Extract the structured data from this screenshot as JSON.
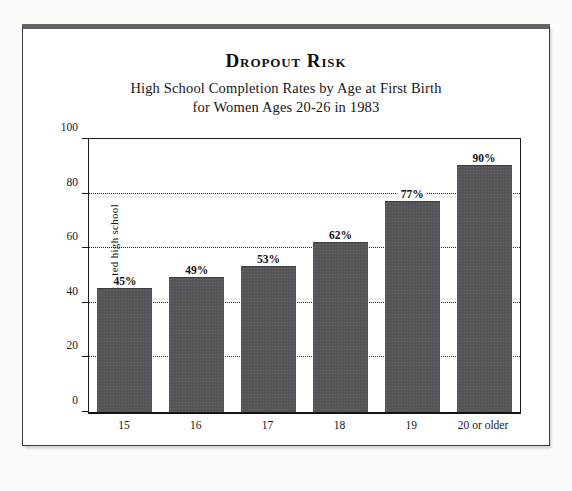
{
  "figure": {
    "title": "Dropout Risk",
    "subtitle_line1": "High School Completion Rates by Age at First Birth",
    "subtitle_line2": "for Women Ages 20-26 in 1983"
  },
  "colors": {
    "bar_fill": "#56565a",
    "frame": "#3c3c40",
    "text": "#16161a",
    "page_background": "#fbfbfa",
    "plot_background": "#ffffff"
  },
  "chart_data": {
    "type": "bar",
    "title": "Dropout Risk",
    "subtitle": "High School Completion Rates by Age at First Birth for Women Ages 20-26 in 1983",
    "xlabel": "Age of mother at first birth",
    "ylabel": "Percent completed high school",
    "categories": [
      "15",
      "16",
      "17",
      "18",
      "19",
      "20 or older"
    ],
    "values": [
      45,
      49,
      53,
      62,
      77,
      90
    ],
    "data_labels": [
      "45%",
      "49%",
      "53%",
      "62%",
      "77%",
      "90%"
    ],
    "ylim": [
      0,
      100
    ],
    "yticks": [
      0,
      20,
      40,
      60,
      80,
      100
    ],
    "ytick_labels": [
      "0",
      "20",
      "40",
      "60",
      "80",
      "100"
    ],
    "gridlines": [
      20,
      40,
      60,
      80
    ],
    "grid": true,
    "grid_style": "dotted",
    "legend": null,
    "legend_position": "none",
    "orientation": "vertical"
  }
}
